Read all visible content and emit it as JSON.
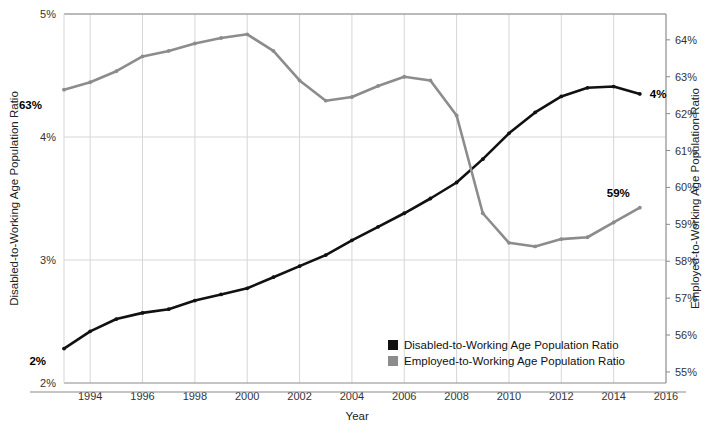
{
  "chart_data": {
    "type": "line",
    "title": "",
    "xlabel": "Year",
    "ylabel_left": "Disabled-to-Working Age Population Ratio",
    "ylabel_right": "Employed-to-Working Age Population Ratio",
    "xlim": [
      1993,
      2016
    ],
    "x_ticks": [
      1994,
      1996,
      1998,
      2000,
      2002,
      2004,
      2006,
      2008,
      2010,
      2012,
      2014,
      2016
    ],
    "x_tick_labels": [
      "1994",
      "1996",
      "1998",
      "2000",
      "2002",
      "2004",
      "2006",
      "2008",
      "2010",
      "2012",
      "2014",
      "2016"
    ],
    "ylim_left": [
      2,
      5
    ],
    "y_ticks_left": [
      2,
      3,
      4,
      5
    ],
    "y_tick_labels_left": [
      "2%",
      "3%",
      "4%",
      "5%"
    ],
    "ylim_right": [
      54.7,
      64.7
    ],
    "y_ticks_right": [
      55,
      56,
      57,
      58,
      59,
      60,
      61,
      62,
      63,
      64
    ],
    "y_tick_labels_right": [
      "55%",
      "56%",
      "57%",
      "58%",
      "59%",
      "60%",
      "61%",
      "62%",
      "63%",
      "64%"
    ],
    "grid": true,
    "legend_position": "inside-bottom-right",
    "series": [
      {
        "name": "Disabled-to-Working Age Population Ratio",
        "axis": "left",
        "color": "#111111",
        "x": [
          1993,
          1994,
          1995,
          1996,
          1997,
          1998,
          1999,
          2000,
          2001,
          2002,
          2003,
          2004,
          2005,
          2006,
          2007,
          2008,
          2009,
          2010,
          2011,
          2012,
          2013,
          2014,
          2015
        ],
        "values": [
          2.28,
          2.42,
          2.52,
          2.57,
          2.6,
          2.67,
          2.72,
          2.77,
          2.86,
          2.95,
          3.04,
          3.16,
          3.27,
          3.38,
          3.5,
          3.63,
          3.82,
          4.03,
          4.2,
          4.33,
          4.4,
          4.41,
          4.35
        ]
      },
      {
        "name": "Employed-to-Working Age Population Ratio",
        "axis": "right",
        "color": "#8c8c8c",
        "x": [
          1993,
          1994,
          1995,
          1996,
          1997,
          1998,
          1999,
          2000,
          2001,
          2002,
          2003,
          2004,
          2005,
          2006,
          2007,
          2008,
          2009,
          2010,
          2011,
          2012,
          2013,
          2014,
          2015
        ],
        "values": [
          62.65,
          62.85,
          63.15,
          63.55,
          63.7,
          63.9,
          64.05,
          64.15,
          63.7,
          62.9,
          62.35,
          62.45,
          62.75,
          63.0,
          62.9,
          61.95,
          59.3,
          58.5,
          58.4,
          58.6,
          58.65,
          59.05,
          59.45
        ]
      }
    ],
    "annotations": [
      {
        "text": "2%",
        "x": 1993,
        "axis": "left",
        "value": 2.28,
        "dx": -18,
        "dy": 16
      },
      {
        "text": "4%",
        "x": 2015,
        "axis": "left",
        "value": 4.35,
        "dx": 10,
        "dy": 4
      },
      {
        "text": "63%",
        "x": 1993,
        "axis": "right",
        "value": 62.65,
        "dx": -22,
        "dy": 19
      },
      {
        "text": "59%",
        "x": 2015,
        "axis": "right",
        "value": 59.45,
        "dx": -10,
        "dy": -11
      }
    ],
    "legend": [
      {
        "label": "Disabled-to-Working Age Population Ratio",
        "color": "#111111"
      },
      {
        "label": "Employed-to-Working Age Population Ratio",
        "color": "#8c8c8c"
      }
    ]
  }
}
